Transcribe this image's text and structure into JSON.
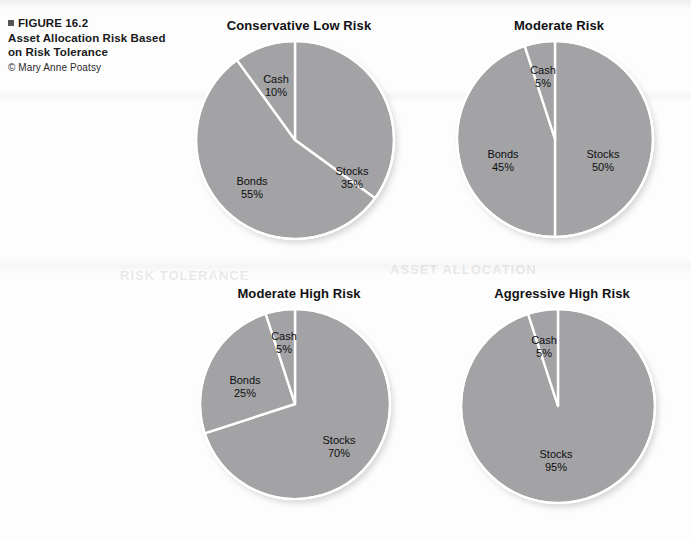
{
  "figure": {
    "marker_icon": "square-bullet-icon",
    "label": "FIGURE 16.2",
    "title_line1": "Asset Allocation Risk Based",
    "title_line2": "on Risk Tolerance",
    "credit": "© Mary Anne Poatsy"
  },
  "palette": {
    "slice_fill": "#a3a3a5",
    "slice_stroke": "#ffffff",
    "label_text": "#0e0e10",
    "title_text": "#111114",
    "page_background": "#fdfdfd"
  },
  "ghost_artifacts": [
    {
      "text": "ASSET ALLOCATION",
      "x": 390,
      "y": 262,
      "size": 13
    },
    {
      "text": "RISK TOLERANCE",
      "x": 120,
      "y": 268,
      "size": 13
    }
  ],
  "chart_data": [
    {
      "type": "pie",
      "title": "Conservative Low Risk",
      "categories": [
        "Stocks",
        "Bonds",
        "Cash"
      ],
      "values": [
        35,
        55,
        10
      ],
      "unit": "%",
      "start_angle": 0,
      "labels": [
        {
          "name": "Stocks",
          "value": "35%",
          "lx": 57,
          "ly": 38
        },
        {
          "name": "Bonds",
          "value": "55%",
          "lx": -43,
          "ly": 48
        },
        {
          "name": "Cash",
          "value": "10%",
          "lx": -19,
          "ly": -54
        }
      ]
    },
    {
      "type": "pie",
      "title": "Moderate Risk",
      "categories": [
        "Stocks",
        "Bonds",
        "Cash"
      ],
      "values": [
        50,
        45,
        5
      ],
      "unit": "%",
      "start_angle": 0,
      "labels": [
        {
          "name": "Stocks",
          "value": "50%",
          "lx": 48,
          "ly": 22
        },
        {
          "name": "Bonds",
          "value": "45%",
          "lx": -52,
          "ly": 22
        },
        {
          "name": "Cash",
          "value": "5%",
          "lx": -12,
          "ly": -62
        }
      ]
    },
    {
      "type": "pie",
      "title": "Moderate High Risk",
      "categories": [
        "Stocks",
        "Bonds",
        "Cash"
      ],
      "values": [
        70,
        25,
        5
      ],
      "unit": "%",
      "start_angle": 0,
      "labels": [
        {
          "name": "Stocks",
          "value": "70%",
          "lx": 44,
          "ly": 43
        },
        {
          "name": "Bonds",
          "value": "25%",
          "lx": -50,
          "ly": -17
        },
        {
          "name": "Cash",
          "value": "5%",
          "lx": -11,
          "ly": -61
        }
      ]
    },
    {
      "type": "pie",
      "title": "Aggressive High Risk",
      "categories": [
        "Stocks",
        "Cash"
      ],
      "values": [
        95,
        5
      ],
      "unit": "%",
      "start_angle": 0,
      "labels": [
        {
          "name": "Stocks",
          "value": "95%",
          "lx": -2,
          "ly": 55
        },
        {
          "name": "Cash",
          "value": "5%",
          "lx": -14,
          "ly": -59
        }
      ]
    }
  ],
  "chart_geometry": [
    {
      "left": 196,
      "top": 18,
      "width": 206,
      "radius": 99
    },
    {
      "left": 458,
      "top": 18,
      "width": 202,
      "radius": 98
    },
    {
      "left": 198,
      "top": 286,
      "width": 202,
      "radius": 95
    },
    {
      "left": 460,
      "top": 286,
      "width": 204,
      "radius": 97
    }
  ]
}
